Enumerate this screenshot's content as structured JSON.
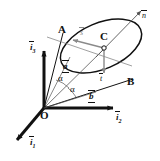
{
  "figure": {
    "background": "#ffffff",
    "colors": {
      "stroke": "#111111",
      "accent_gray": "#8a8a8a",
      "ellipse": "#111111",
      "fill": "#ffffff"
    },
    "points": {
      "origin": "O",
      "apex_left": "A",
      "apex_right": "B",
      "center": "C"
    },
    "vectors": {
      "a": "a",
      "b": "b",
      "s": "s",
      "t": "t",
      "n": "n"
    },
    "angles": {
      "alpha_upper": "α",
      "alpha_lower": "α"
    },
    "axes": {
      "i1": "i",
      "i1_sub": "1",
      "i2": "i",
      "i2_sub": "2",
      "i3": "i",
      "i3_sub": "3"
    }
  }
}
